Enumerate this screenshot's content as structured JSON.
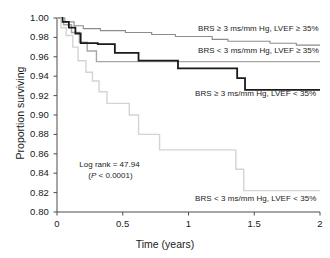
{
  "chart_data": {
    "type": "line",
    "title": "",
    "xlabel": "Time (years)",
    "ylabel": "Proportion surviving",
    "xlim": [
      0,
      2
    ],
    "ylim": [
      0.8,
      1.0
    ],
    "xticks": [
      "0",
      "0.5",
      "1",
      "1.5",
      "2"
    ],
    "xtick_values": [
      0,
      0.5,
      1,
      1.5,
      2
    ],
    "yticks": [
      "0.80",
      "0.82",
      "0.84",
      "0.86",
      "0.88",
      "0.90",
      "0.92",
      "0.94",
      "0.96",
      "0.98",
      "1.00"
    ],
    "ytick_values": [
      0.8,
      0.82,
      0.84,
      0.86,
      0.88,
      0.9,
      0.92,
      0.94,
      0.96,
      0.98,
      1.0
    ],
    "grid": false,
    "legend_position": "inline-right-of-curves",
    "series": [
      {
        "name": "BRS ≥ 3 ms/mm Hg, LVEF ≥ 35%",
        "color": "#8c8c8c",
        "width": 1.1,
        "label_x": 1.32,
        "label_y": 0.9885,
        "points": [
          [
            0.0,
            1.0
          ],
          [
            0.06,
            1.0
          ],
          [
            0.06,
            0.996
          ],
          [
            0.13,
            0.996
          ],
          [
            0.13,
            0.992
          ],
          [
            0.2,
            0.992
          ],
          [
            0.2,
            0.989
          ],
          [
            0.33,
            0.989
          ],
          [
            0.33,
            0.987
          ],
          [
            0.52,
            0.987
          ],
          [
            0.52,
            0.985
          ],
          [
            0.72,
            0.985
          ],
          [
            0.72,
            0.983
          ],
          [
            0.9,
            0.983
          ],
          [
            0.9,
            0.981
          ],
          [
            1.18,
            0.981
          ],
          [
            1.18,
            0.978
          ],
          [
            1.3,
            0.978
          ],
          [
            1.3,
            0.976
          ],
          [
            1.62,
            0.976
          ],
          [
            1.62,
            0.974
          ],
          [
            1.82,
            0.974
          ],
          [
            1.82,
            0.972
          ],
          [
            2.0,
            0.972
          ]
        ]
      },
      {
        "name": "BRS < 3 ms/mm Hg, LVEF ≥ 35%",
        "color": "#a6a6a6",
        "width": 1.4,
        "label_x": 1.32,
        "label_y": 0.9655,
        "points": [
          [
            0.0,
            1.0
          ],
          [
            0.05,
            1.0
          ],
          [
            0.05,
            0.993
          ],
          [
            0.11,
            0.993
          ],
          [
            0.11,
            0.985
          ],
          [
            0.17,
            0.985
          ],
          [
            0.17,
            0.975
          ],
          [
            0.23,
            0.975
          ],
          [
            0.23,
            0.966
          ],
          [
            0.3,
            0.966
          ],
          [
            0.3,
            0.955
          ],
          [
            1.24,
            0.955
          ],
          [
            1.24,
            0.955
          ],
          [
            2.0,
            0.955
          ]
        ]
      },
      {
        "name": "BRS ≥ 3 ms/mm Hg, LVEF < 35%",
        "color": "#1a1a1a",
        "width": 1.8,
        "label_x": 1.05,
        "label_y": 0.9215,
        "points": [
          [
            0.0,
            1.0
          ],
          [
            0.04,
            1.0
          ],
          [
            0.04,
            0.996
          ],
          [
            0.09,
            0.996
          ],
          [
            0.09,
            0.99
          ],
          [
            0.14,
            0.99
          ],
          [
            0.14,
            0.984
          ],
          [
            0.18,
            0.984
          ],
          [
            0.18,
            0.974
          ],
          [
            0.31,
            0.974
          ],
          [
            0.31,
            0.973
          ],
          [
            0.44,
            0.973
          ],
          [
            0.44,
            0.964
          ],
          [
            0.62,
            0.964
          ],
          [
            0.62,
            0.956
          ],
          [
            0.92,
            0.956
          ],
          [
            0.92,
            0.948
          ],
          [
            1.37,
            0.948
          ],
          [
            1.37,
            0.938
          ],
          [
            1.43,
            0.938
          ],
          [
            1.43,
            0.926
          ],
          [
            2.0,
            0.926
          ]
        ]
      },
      {
        "name": "BRS < 3 ms/mm Hg, LVEF < 35%",
        "color": "#d4d4d4",
        "width": 1.4,
        "label_x": 1.05,
        "label_y": 0.8135,
        "points": [
          [
            0.0,
            1.0
          ],
          [
            0.03,
            1.0
          ],
          [
            0.03,
            0.99
          ],
          [
            0.07,
            0.99
          ],
          [
            0.07,
            0.982
          ],
          [
            0.12,
            0.982
          ],
          [
            0.12,
            0.97
          ],
          [
            0.16,
            0.97
          ],
          [
            0.16,
            0.956
          ],
          [
            0.22,
            0.956
          ],
          [
            0.22,
            0.944
          ],
          [
            0.27,
            0.944
          ],
          [
            0.27,
            0.935
          ],
          [
            0.32,
            0.935
          ],
          [
            0.32,
            0.924
          ],
          [
            0.38,
            0.924
          ],
          [
            0.38,
            0.912
          ],
          [
            0.55,
            0.912
          ],
          [
            0.55,
            0.9
          ],
          [
            0.62,
            0.9
          ],
          [
            0.62,
            0.88
          ],
          [
            0.78,
            0.88
          ],
          [
            0.78,
            0.864
          ],
          [
            1.36,
            0.864
          ],
          [
            1.36,
            0.844
          ],
          [
            1.42,
            0.844
          ],
          [
            1.42,
            0.822
          ],
          [
            2.0,
            0.822
          ]
        ]
      }
    ],
    "annotation": {
      "line1": "Log rank = 47.94",
      "line2_prefix": "(",
      "line2_italic": "P",
      "line2_suffix": " < 0.0001)",
      "x": 0.17,
      "y": 0.848
    }
  }
}
